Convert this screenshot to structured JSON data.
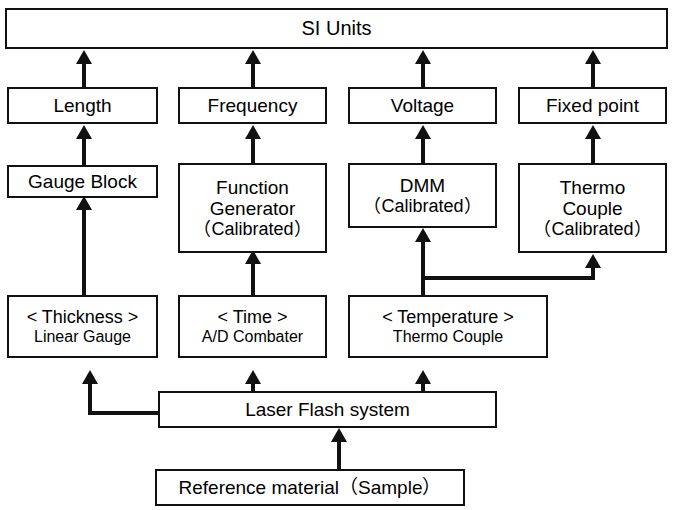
{
  "diagram": {
    "type": "flow-diagram",
    "background_color": "#ffffff",
    "line_color": "#111111",
    "nodes": [
      {
        "id": "si-units",
        "lines": [
          "SI Units"
        ]
      },
      {
        "id": "length",
        "lines": [
          "Length"
        ]
      },
      {
        "id": "frequency",
        "lines": [
          "Frequency"
        ]
      },
      {
        "id": "voltage",
        "lines": [
          "Voltage"
        ]
      },
      {
        "id": "fixed-point",
        "lines": [
          "Fixed point"
        ]
      },
      {
        "id": "gauge-block",
        "lines": [
          "Gauge Block"
        ]
      },
      {
        "id": "function-generator",
        "lines": [
          "Function",
          "Generator",
          "（Calibrated）"
        ]
      },
      {
        "id": "dmm",
        "lines": [
          "DMM",
          "（Calibrated）"
        ]
      },
      {
        "id": "thermo-couple-cal",
        "lines": [
          "Thermo",
          "Couple",
          "（Calibrated）"
        ]
      },
      {
        "id": "thickness",
        "lines": [
          "< Thickness >",
          "Linear Gauge"
        ]
      },
      {
        "id": "time",
        "lines": [
          "< Time >",
          "A/D Combater"
        ]
      },
      {
        "id": "temperature",
        "lines": [
          "< Temperature >",
          "Thermo Couple"
        ]
      },
      {
        "id": "laser-flash-system",
        "lines": [
          "Laser Flash system"
        ]
      },
      {
        "id": "reference-material",
        "lines": [
          "Reference material（Sample）"
        ]
      }
    ],
    "edges": [
      {
        "from": "length",
        "to": "si-units"
      },
      {
        "from": "frequency",
        "to": "si-units"
      },
      {
        "from": "voltage",
        "to": "si-units"
      },
      {
        "from": "fixed-point",
        "to": "si-units"
      },
      {
        "from": "gauge-block",
        "to": "length"
      },
      {
        "from": "function-generator",
        "to": "frequency"
      },
      {
        "from": "dmm",
        "to": "voltage"
      },
      {
        "from": "thermo-couple-cal",
        "to": "fixed-point"
      },
      {
        "from": "thickness",
        "to": "gauge-block"
      },
      {
        "from": "time",
        "to": "function-generator"
      },
      {
        "from": "temperature",
        "to": "dmm"
      },
      {
        "from": "temperature",
        "to": "thermo-couple-cal"
      },
      {
        "from": "laser-flash-system",
        "to": "thickness"
      },
      {
        "from": "laser-flash-system",
        "to": "time"
      },
      {
        "from": "laser-flash-system",
        "to": "temperature"
      },
      {
        "from": "reference-material",
        "to": "laser-flash-system"
      }
    ]
  }
}
